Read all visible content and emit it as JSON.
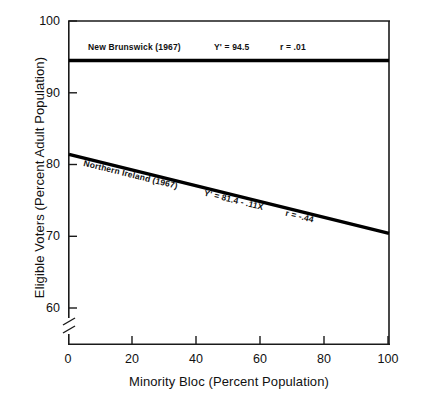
{
  "chart_data": {
    "type": "line",
    "title": "",
    "xlabel": "Minority Bloc (Percent Population)",
    "ylabel": "Eligible Voters (Percent Adult Population)",
    "xlim": [
      0,
      100
    ],
    "ylim": [
      60,
      100
    ],
    "xticks": [
      "0",
      "20",
      "40",
      "60",
      "80",
      "100"
    ],
    "yticks": [
      "60",
      "70",
      "80",
      "90",
      "100"
    ],
    "grid": false,
    "legend": "inline-annotations",
    "axis_break": "y-axis below 60",
    "series": [
      {
        "name": "New Brunswick (1967)",
        "x": [
          0,
          100
        ],
        "values": [
          94.5,
          94.5
        ],
        "equation": "Y' = 94.5",
        "correlation": "r = .01",
        "slope": 0.0,
        "intercept": 94.5,
        "color": "#000000"
      },
      {
        "name": "Northern Ireland (1967)",
        "x": [
          0,
          100
        ],
        "values": [
          81.4,
          70.4
        ],
        "equation": "Y' = 81.4 - .11X",
        "correlation": "r = -.44",
        "slope": -0.11,
        "intercept": 81.4,
        "color": "#000000"
      }
    ]
  },
  "axes": {
    "y_title": "Eligible Voters (Percent Adult Population)",
    "x_title": "Minority Bloc (Percent Population)",
    "y_tick_labels": [
      "100",
      "90",
      "80",
      "70",
      "60"
    ],
    "x_tick_labels": [
      "0",
      "20",
      "40",
      "60",
      "80",
      "100"
    ]
  },
  "annotations": {
    "new_brunswick": {
      "label": "New Brunswick (1967)",
      "equation": "Y' = 94.5",
      "r": "r = .01"
    },
    "northern_ireland": {
      "label": "Northern Ireland (1967)",
      "equation": "Y' = 81.4 - .11X",
      "r": "r = -.44"
    }
  },
  "colors": {
    "line": "#000000",
    "frame": "#1a1a1a",
    "background": "#ffffff",
    "text": "#111111"
  }
}
